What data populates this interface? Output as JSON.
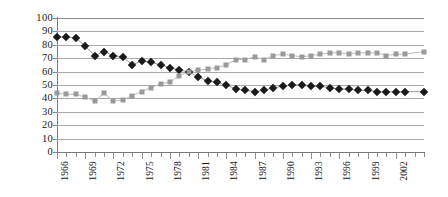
{
  "chart_data": {
    "type": "line",
    "title": "",
    "subtitle": "",
    "xlabel": "",
    "ylabel": "",
    "ylim": [
      0,
      100
    ],
    "ytick_step": 10,
    "yticks": [
      "0",
      "10",
      "20",
      "30",
      "40",
      "50",
      "60",
      "70",
      "80",
      "90",
      "100"
    ],
    "grid": true,
    "legend": "none",
    "legend_position": "none",
    "x": [
      1966,
      1967,
      1968,
      1969,
      1970,
      1971,
      1972,
      1973,
      1974,
      1975,
      1976,
      1977,
      1978,
      1979,
      1980,
      1981,
      1982,
      1983,
      1984,
      1985,
      1986,
      1987,
      1988,
      1989,
      1990,
      1991,
      1992,
      1993,
      1994,
      1995,
      1996,
      1997,
      1998,
      1999,
      2000,
      2001,
      2002,
      2003,
      2005
    ],
    "xtick_labels": [
      "1966",
      "1969",
      "1972",
      "1975",
      "1978",
      "1981",
      "1984",
      "1987",
      "1990",
      "1993",
      "1996",
      "1999",
      "2002"
    ],
    "xtick_label_years": [
      1966,
      1969,
      1972,
      1975,
      1978,
      1981,
      1984,
      1987,
      1990,
      1993,
      1996,
      1999,
      2002
    ],
    "xtick_rotation": -90,
    "series": [
      {
        "name": "black-diamond-series",
        "marker": "diamond",
        "color": "#1a1a1a",
        "line_color": "#9a9a9a",
        "values": [
          86,
          86,
          85,
          79,
          72,
          75,
          72,
          71,
          65,
          68,
          67,
          65,
          63,
          61,
          60,
          56,
          53,
          52,
          50,
          47,
          46,
          45,
          46,
          48,
          49,
          50,
          50,
          49,
          49,
          48,
          47,
          47,
          46,
          46,
          45,
          45,
          45,
          45,
          45
        ]
      },
      {
        "name": "gray-square-series",
        "marker": "square",
        "color": "#9a9a9a",
        "line_color": "#bdbdbd",
        "values": [
          44,
          43,
          43,
          41,
          38,
          44,
          38,
          39,
          42,
          45,
          48,
          51,
          52,
          57,
          60,
          61,
          62,
          63,
          65,
          69,
          69,
          71,
          69,
          72,
          73,
          72,
          71,
          72,
          73,
          74,
          74,
          73,
          74,
          74,
          74,
          72,
          73,
          73,
          75
        ]
      }
    ]
  }
}
